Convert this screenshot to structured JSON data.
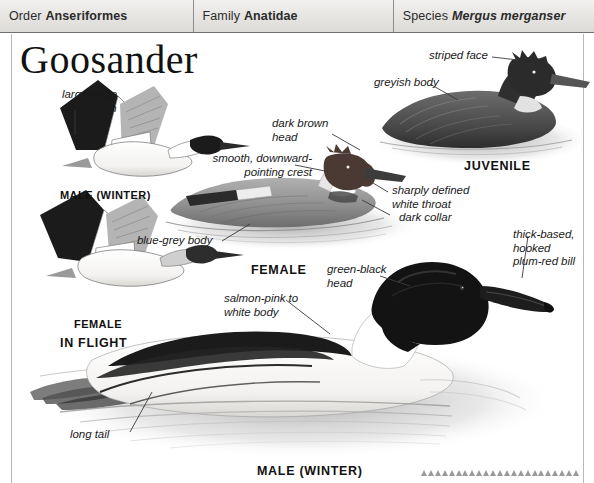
{
  "page": {
    "title": "Goosander",
    "background_color": "#ffffff"
  },
  "taxonomy": {
    "cells": [
      {
        "key": "Order",
        "value": "Anseriformes",
        "italic": false
      },
      {
        "key": "Family",
        "value": "Anatidae",
        "italic": false
      },
      {
        "key": "Species",
        "value": "Mergus merganser",
        "italic": true
      }
    ]
  },
  "annotations": [
    {
      "id": "large-white-wing-patch",
      "text": "large white\nwing patch"
    },
    {
      "id": "smooth-downward-pointing-crest",
      "text": "smooth, downward-\npointing crest"
    },
    {
      "id": "dark-brown-head",
      "text": "dark brown\nhead"
    },
    {
      "id": "blue-grey-body",
      "text": "blue-grey body"
    },
    {
      "id": "sharply-defined-white-throat",
      "text": "sharply defined\nwhite throat"
    },
    {
      "id": "dark-collar",
      "text": "dark collar"
    },
    {
      "id": "striped-face",
      "text": "striped face"
    },
    {
      "id": "greyish-body",
      "text": "greyish body"
    },
    {
      "id": "thick-based-hooked-plum-red-bill",
      "text": "thick-based,\nhooked\nplum-red bill"
    },
    {
      "id": "green-black-head",
      "text": "green-black\nhead"
    },
    {
      "id": "salmon-pink-to-white-body",
      "text": "salmon-pink to\nwhite body"
    },
    {
      "id": "long-tail",
      "text": "long tail"
    }
  ],
  "captions": [
    {
      "id": "male-winter-flight",
      "text": "MALE (WINTER)"
    },
    {
      "id": "female-flight",
      "text": "FEMALE"
    },
    {
      "id": "in-flight",
      "text": "IN FLIGHT"
    },
    {
      "id": "female-swimming",
      "text": "FEMALE"
    },
    {
      "id": "juvenile",
      "text": "JUVENILE"
    },
    {
      "id": "male-winter-swimming",
      "text": "MALE (WINTER)"
    }
  ],
  "colors": {
    "header_border": "#6f6f6f",
    "ink": "#1a1a1a",
    "plate_dark": "#1b1b1b",
    "plate_mid": "#8e8e8e",
    "plate_light": "#d9d9d9"
  }
}
